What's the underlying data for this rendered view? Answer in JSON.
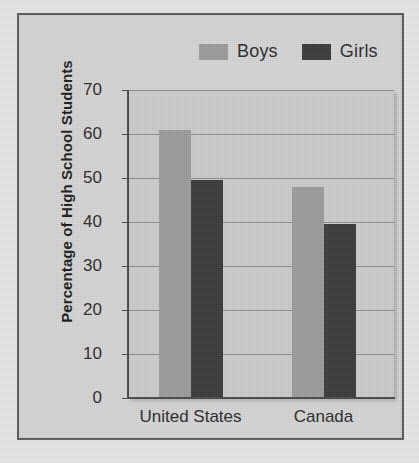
{
  "chart_data": {
    "type": "bar",
    "title": "",
    "xlabel": "",
    "ylabel": "Percentage of High School Students",
    "categories": [
      "United States",
      "Canada"
    ],
    "series": [
      {
        "name": "Boys",
        "color": "#9c9c9c",
        "values": [
          61,
          48
        ]
      },
      {
        "name": "Girls",
        "color": "#3b3b3b",
        "values": [
          49.5,
          39.5
        ]
      }
    ],
    "ylim": [
      0,
      70
    ],
    "yticks": [
      0,
      10,
      20,
      30,
      40,
      50,
      60,
      70
    ],
    "ytick_labels": [
      "0",
      "10",
      "20",
      "30",
      "40",
      "50",
      "60",
      "70"
    ],
    "grid": true,
    "legend_position": "top-right"
  },
  "legend": {
    "items": [
      {
        "label": "Boys",
        "swatch": "boys"
      },
      {
        "label": "Girls",
        "swatch": "girls"
      }
    ]
  },
  "colors": {
    "page_background": "#e8e8e8",
    "frame_background": "#d6d6d6",
    "frame_border": "#5d5d5d",
    "plot_background": "#cdcdcd",
    "gridline": "#8d8d8d",
    "axis": "#4a4a4a",
    "boys_bar": "#9c9c9c",
    "girls_bar": "#3b3b3b",
    "text": "#2b2b2b"
  }
}
